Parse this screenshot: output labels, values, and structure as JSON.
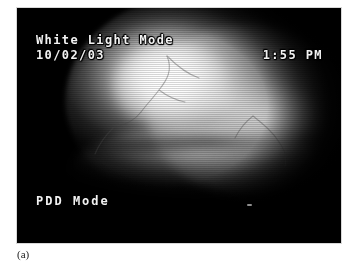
{
  "figure": {
    "caption": "(a)"
  },
  "video_frame": {
    "label": "endoscopic-video-frame",
    "background_color": "#000000",
    "osd": {
      "mode_label": "White Light Mode",
      "date": "10/02/03",
      "time": "1:55 PM",
      "secondary_mode_label": "PDD Mode"
    }
  },
  "colors": {
    "frame_background": "#000000",
    "osd_text": "#f2f2f2",
    "page_background": "#ffffff",
    "caption_text": "#1a1a1a"
  }
}
